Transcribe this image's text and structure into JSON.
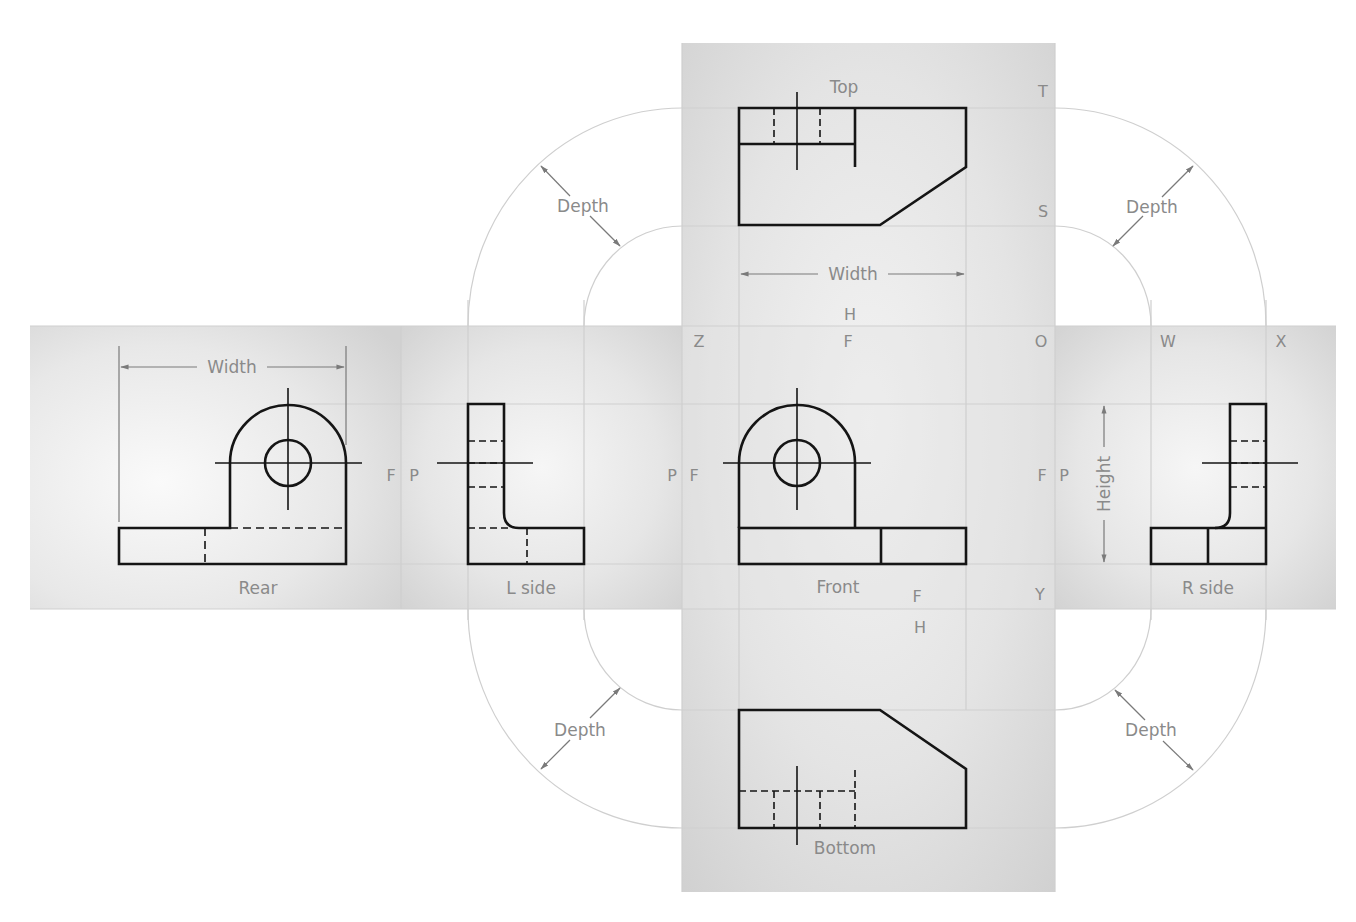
{
  "diagram": {
    "views": {
      "top": {
        "label": "Top"
      },
      "rear": {
        "label": "Rear"
      },
      "left_side": {
        "label": "L side"
      },
      "front": {
        "label": "Front"
      },
      "right_side": {
        "label": "R side"
      },
      "bottom": {
        "label": "Bottom"
      }
    },
    "dimensions": {
      "width_top": "Width",
      "width_rear": "Width",
      "height": "Height",
      "depth_top_left": "Depth",
      "depth_top_right": "Depth",
      "depth_bottom_left": "Depth",
      "depth_bottom_right": "Depth"
    },
    "fold_letters": {
      "T": "T",
      "S": "S",
      "H_top": "H",
      "Z": "Z",
      "F_top": "F",
      "O": "O",
      "W": "W",
      "X": "X",
      "F_rear": "F",
      "P_left1": "P",
      "P_left2": "P",
      "F_left2": "F",
      "F_right1": "F",
      "P_right1": "P",
      "F_bottom": "F",
      "H_bottom": "H",
      "Y": "Y"
    },
    "colors": {
      "object_line": "#151515",
      "construction_line": "#c8c8c8",
      "label_text": "#8a8a8a",
      "panel_light": "#f4f4f4",
      "panel_dark": "#d6d6d6"
    }
  }
}
